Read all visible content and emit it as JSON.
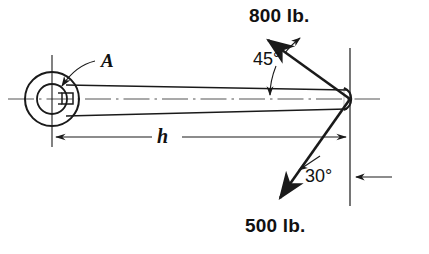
{
  "figure": {
    "background_color": "#ffffff",
    "line_color": "#1a1a1a",
    "centerline_color": "#555555"
  },
  "labels": {
    "point_a": "A",
    "dimension_h": "h",
    "force_upper": "800 lb.",
    "force_lower": "500 lb.",
    "angle_upper": "45°",
    "angle_lower": "30°"
  },
  "geometry": {
    "hub_center_x": 52,
    "hub_center_y": 99,
    "hub_outer_radius": 27,
    "hub_bore_radius": 15,
    "pin_x": 350,
    "pin_y": 99,
    "pin_radius": 12,
    "left_reference_x": 52,
    "right_reference_x": 350
  },
  "forces": [
    {
      "name": "force-800",
      "magnitude": "800 lb.",
      "value": 800,
      "unit": "lb.",
      "angle_text": "45°",
      "angle_value": 45,
      "angle_reference": "bar axis",
      "direction": "up-left"
    },
    {
      "name": "force-500",
      "magnitude": "500 lb.",
      "value": 500,
      "unit": "lb.",
      "angle_text": "30°",
      "angle_value": 30,
      "angle_reference": "vertical",
      "direction": "down-left"
    }
  ],
  "dimensions": [
    {
      "name": "length-h",
      "symbol": "h",
      "from": "hub center A",
      "to": "pin center"
    }
  ],
  "icons": {
    "arrowhead": "arrowhead-icon",
    "keyway": "keyway-icon",
    "centerline": "centerline-icon"
  }
}
